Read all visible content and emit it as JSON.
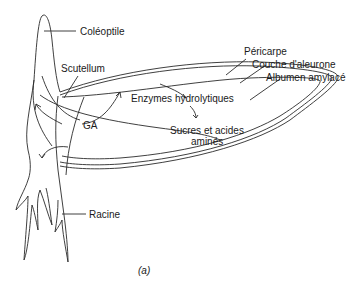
{
  "diagram": {
    "type": "biological-schematic",
    "labels": {
      "coleoptile": "Coléoptile",
      "scutellum": "Scutellum",
      "pericarp": "Péricarpe",
      "aleurone": "Couche d'aleurone",
      "endosperm": "Albumen amylacé",
      "enzymes": "Enzymes hydrolytiques",
      "sugars_line1": "Sucres et acides",
      "sugars_line2": "aminés",
      "ga": "GA",
      "root": "Racine"
    },
    "caption": "(a)",
    "line_color": "#2a2a2a"
  }
}
